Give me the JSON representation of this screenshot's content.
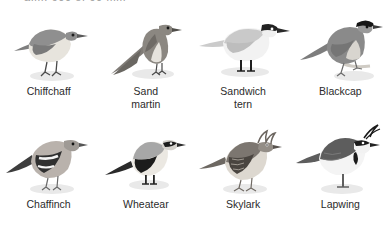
{
  "page": {
    "top_heading_fragment": "a.m. 600 of 60 mm",
    "background_color": "#ffffff",
    "text_color": "#2b2b2b",
    "shadow_color": "#e8e8e8"
  },
  "birds": [
    {
      "name_line1": "Chiffchaff",
      "name_line2": "",
      "icon": "bird-chiffchaff-icon",
      "colors": {
        "upper": "#8f8f8f",
        "under": "#ece9e2",
        "dark": "#6f6f6f",
        "bill": "#5a5a5a",
        "leg": "#4a4a4a"
      }
    },
    {
      "name_line1": "Sand",
      "name_line2": "martin",
      "icon": "bird-sand-martin-icon",
      "colors": {
        "upper": "#8b8781",
        "under": "#e6e3dd",
        "dark": "#6a6762",
        "bill": "#4f4d49",
        "leg": "#4a4a4a"
      }
    },
    {
      "name_line1": "Sandwich",
      "name_line2": "tern",
      "icon": "bird-sandwich-tern-icon",
      "colors": {
        "upper": "#c9c9c9",
        "under": "#f2f2f2",
        "dark": "#222222",
        "bill": "#2a2a2a",
        "leg": "#1f1f1f"
      }
    },
    {
      "name_line1": "Blackcap",
      "name_line2": "",
      "icon": "bird-blackcap-icon",
      "colors": {
        "upper": "#8a8a8a",
        "under": "#d8d5cf",
        "dark": "#151515",
        "bill": "#3a3a3a",
        "leg": "#6c6c6c"
      }
    },
    {
      "name_line1": "Chaffinch",
      "name_line2": "",
      "icon": "bird-chaffinch-icon",
      "colors": {
        "upper": "#3d3d3d",
        "under": "#b9b2ac",
        "dark": "#2a2a2a",
        "bill": "#555555",
        "leg": "#6a6a6a"
      }
    },
    {
      "name_line1": "Wheatear",
      "name_line2": "",
      "icon": "bird-wheatear-icon",
      "colors": {
        "upper": "#a7a7a7",
        "under": "#ebe8e2",
        "dark": "#1c1c1c",
        "bill": "#2b2b2b",
        "leg": "#242424"
      }
    },
    {
      "name_line1": "Skylark",
      "name_line2": "",
      "icon": "bird-skylark-icon",
      "colors": {
        "upper": "#7c7670",
        "under": "#ddd8d0",
        "dark": "#4a4540",
        "bill": "#58534e",
        "leg": "#706a64"
      }
    },
    {
      "name_line1": "Lapwing",
      "name_line2": "",
      "icon": "bird-lapwing-icon",
      "colors": {
        "upper": "#5d5d5d",
        "under": "#f4f4f4",
        "dark": "#1a1a1a",
        "bill": "#222222",
        "leg": "#5f5f5f"
      }
    }
  ]
}
